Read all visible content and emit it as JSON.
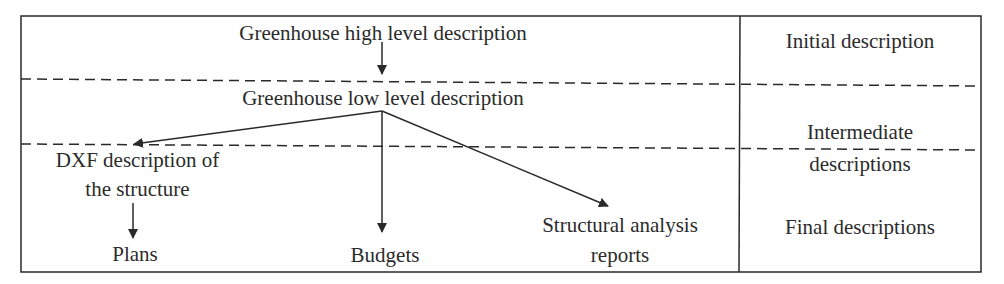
{
  "diagram": {
    "nodes": {
      "high_level": "Greenhouse high level description",
      "low_level": "Greenhouse low level description",
      "dxf_line1": "DXF description of",
      "dxf_line2": "the structure",
      "plans": "Plans",
      "budgets": "Budgets",
      "structural_line1": "Structural analysis",
      "structural_line2": "reports"
    },
    "stages": {
      "initial": "Initial description",
      "intermediate_line1": "Intermediate",
      "intermediate_line2": "descriptions",
      "final": "Final descriptions"
    },
    "edges": [
      {
        "from": "Greenhouse high level description",
        "to": "Greenhouse low level description"
      },
      {
        "from": "Greenhouse low level description",
        "to": "DXF description of the structure"
      },
      {
        "from": "Greenhouse low level description",
        "to": "Budgets"
      },
      {
        "from": "Greenhouse low level description",
        "to": "Structural analysis reports"
      },
      {
        "from": "DXF description of the structure",
        "to": "Plans"
      }
    ],
    "colors": {
      "line": "#2a2a2a",
      "background": "#ffffff"
    }
  }
}
